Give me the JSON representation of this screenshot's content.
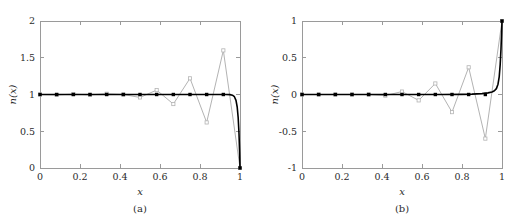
{
  "figure": {
    "panels": [
      {
        "id": "a",
        "caption": "(a)",
        "xlabel": "x",
        "ylabel": "n(x)",
        "ylabel_parts": {
          "fn": "n",
          "arg": "(x)"
        }
      },
      {
        "id": "b",
        "caption": "(b)",
        "xlabel": "x",
        "ylabel": "n(x)",
        "ylabel_parts": {
          "fn": "n",
          "arg": "(x)"
        }
      }
    ]
  },
  "colors": {
    "exact_curve": "#000000",
    "oscillating_curve": "#b3b3b3",
    "axis": "#9a9a9a",
    "text": "#2b2b2b",
    "background": "#ffffff"
  },
  "chart_data": [
    {
      "type": "line",
      "panel": "a",
      "title": "",
      "xlabel": "x",
      "ylabel": "n(x)",
      "xlim": [
        0,
        1
      ],
      "ylim": [
        0,
        2
      ],
      "xticks": [
        0,
        0.2,
        0.4,
        0.6,
        0.8,
        1
      ],
      "xticklabels": [
        "0",
        "0.2",
        "0.4",
        "0.6",
        "0.8",
        "1"
      ],
      "yticks": [
        0,
        0.5,
        1,
        1.5,
        2
      ],
      "yticklabels": [
        "0",
        "0.5",
        "1",
        "1.5",
        "2"
      ],
      "grid": false,
      "legend": "none",
      "series": [
        {
          "name": "exact",
          "style": "solid-black-with-dot-markers",
          "markers": true,
          "x": [
            0,
            0.0833,
            0.1667,
            0.25,
            0.3333,
            0.4167,
            0.5,
            0.5833,
            0.6667,
            0.75,
            0.8333,
            0.9167,
            1
          ],
          "y": [
            1,
            1,
            1,
            1,
            1,
            1,
            1,
            1,
            1,
            1,
            1,
            1,
            0
          ],
          "curve_x": [
            0,
            0.1,
            0.2,
            0.3,
            0.4,
            0.5,
            0.6,
            0.7,
            0.8,
            0.85,
            0.9,
            0.93,
            0.95,
            0.962,
            0.972,
            0.98,
            0.986,
            0.991,
            0.995,
            0.998,
            1
          ],
          "curve_y": [
            1,
            1,
            1,
            1,
            1,
            1,
            1,
            1,
            1,
            1,
            1,
            1,
            0.998,
            0.99,
            0.97,
            0.92,
            0.83,
            0.68,
            0.47,
            0.22,
            0
          ]
        },
        {
          "name": "oscillating",
          "style": "solid-gray-with-open-markers",
          "markers": true,
          "x": [
            0,
            0.0833,
            0.1667,
            0.25,
            0.3333,
            0.4167,
            0.5,
            0.5833,
            0.6667,
            0.75,
            0.8333,
            0.9167,
            1
          ],
          "y": [
            1.0,
            0.995,
            1.005,
            0.995,
            1.01,
            1.0,
            0.96,
            1.06,
            0.87,
            1.22,
            0.62,
            1.6,
            0.0
          ]
        }
      ]
    },
    {
      "type": "line",
      "panel": "b",
      "title": "",
      "xlabel": "x",
      "ylabel": "n(x)",
      "xlim": [
        0,
        1
      ],
      "ylim": [
        -1,
        1
      ],
      "xticks": [
        0,
        0.2,
        0.4,
        0.6,
        0.8,
        1
      ],
      "xticklabels": [
        "0",
        "0.2",
        "0.4",
        "0.6",
        "0.8",
        "1"
      ],
      "yticks": [
        -1,
        -0.5,
        0,
        0.5,
        1
      ],
      "yticklabels": [
        "-1",
        "-0.5",
        "0",
        "0.5",
        "1"
      ],
      "grid": false,
      "legend": "none",
      "series": [
        {
          "name": "exact",
          "style": "solid-black-with-dot-markers",
          "markers": true,
          "x": [
            0,
            0.0833,
            0.1667,
            0.25,
            0.3333,
            0.4167,
            0.5,
            0.5833,
            0.6667,
            0.75,
            0.8333,
            0.9167,
            1
          ],
          "y": [
            0,
            0,
            0,
            0,
            0,
            0,
            0,
            0,
            0,
            0,
            0,
            0,
            1
          ],
          "curve_x": [
            0,
            0.1,
            0.2,
            0.3,
            0.4,
            0.5,
            0.6,
            0.7,
            0.8,
            0.85,
            0.9,
            0.93,
            0.95,
            0.962,
            0.972,
            0.98,
            0.986,
            0.991,
            0.995,
            0.998,
            1
          ],
          "curve_y": [
            0,
            0,
            0,
            0,
            0,
            0,
            0,
            0,
            0.002,
            0.005,
            0.012,
            0.022,
            0.035,
            0.05,
            0.08,
            0.14,
            0.24,
            0.41,
            0.62,
            0.84,
            1
          ]
        },
        {
          "name": "oscillating",
          "style": "solid-gray-with-open-markers",
          "markers": true,
          "x": [
            0,
            0.0833,
            0.1667,
            0.25,
            0.3333,
            0.4167,
            0.5,
            0.5833,
            0.6667,
            0.75,
            0.8333,
            0.9167,
            1
          ],
          "y": [
            0.0,
            0.0,
            0.0,
            0.0,
            0.0,
            -0.015,
            0.04,
            -0.08,
            0.15,
            -0.24,
            0.37,
            -0.6,
            1.0
          ]
        }
      ]
    }
  ]
}
